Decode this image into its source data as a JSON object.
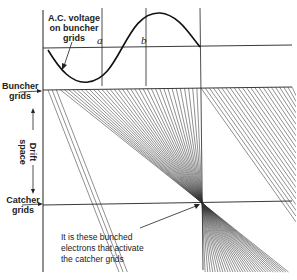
{
  "diagram": {
    "title_label": {
      "line1": "A.C. voltage",
      "line2": "on buncher",
      "line3": "grids"
    },
    "point_a": "a",
    "point_b": "b",
    "buncher_label": {
      "line1": "Buncher",
      "line2": "grids"
    },
    "drift_label": {
      "line1": "Drift",
      "line2": "space"
    },
    "catcher_label": {
      "line1": "Catcher",
      "line2": "grids"
    },
    "annotation": {
      "line1": "It is these bunched",
      "line2": "electrons that activate",
      "line3": "the catcher grids"
    },
    "colors": {
      "ink": "#222222",
      "background": "#ffffff"
    },
    "geometry": {
      "axis_x": 43,
      "ac_baseline_y": 48,
      "buncher_y": 90,
      "catcher_y": 205,
      "vertical_a_x": 102,
      "vertical_b_x": 146,
      "vertical_right_x": 202,
      "focus_point": [
        202,
        203
      ],
      "electron_line_count": 60
    }
  }
}
